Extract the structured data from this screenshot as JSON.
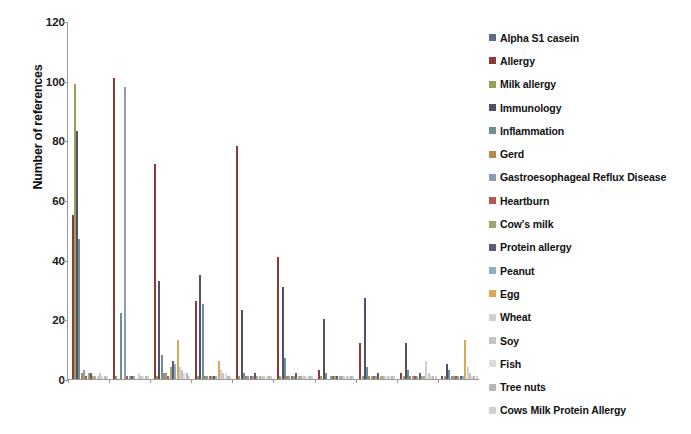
{
  "chart_data": {
    "type": "bar",
    "title": "",
    "xlabel": "",
    "ylabel": "Number of references",
    "ylim": [
      0,
      120
    ],
    "yticks": [
      0,
      20,
      40,
      60,
      80,
      100,
      120
    ],
    "grid": false,
    "legend_position": "right",
    "categories": [
      "MUC5B",
      "FANCD2",
      "MUC6",
      "TPSAB1",
      "MUC16",
      "MAP2K3",
      "NCOR1",
      "PRSS1",
      "KRT18",
      "AQP7"
    ],
    "series": [
      {
        "name": "Alpha S1 casein",
        "color": "#5b6b84",
        "values": [
          0,
          0,
          0,
          0,
          0,
          0,
          0,
          0,
          0,
          0
        ]
      },
      {
        "name": "Allergy",
        "color": "#8c3a33",
        "values": [
          55,
          101,
          72,
          26,
          78,
          41,
          3,
          12,
          2,
          1
        ]
      },
      {
        "name": "Milk allergy",
        "color": "#95a05a",
        "values": [
          99,
          1,
          1,
          1,
          1,
          1,
          1,
          1,
          1,
          1
        ]
      },
      {
        "name": "Immunology",
        "color": "#534f6b",
        "values": [
          83,
          0,
          33,
          35,
          23,
          31,
          20,
          27,
          12,
          5
        ]
      },
      {
        "name": "Inflammation",
        "color": "#6d8e95",
        "values": [
          47,
          22,
          8,
          25,
          2,
          7,
          2,
          4,
          3,
          3
        ]
      },
      {
        "name": "Gerd",
        "color": "#b08a4e",
        "values": [
          2,
          0,
          2,
          1,
          1,
          1,
          0,
          1,
          1,
          1
        ]
      },
      {
        "name": "Gastroesophageal  Reflux Disease",
        "color": "#8d9cb5",
        "values": [
          3,
          98,
          2,
          1,
          1,
          1,
          1,
          1,
          1,
          1
        ]
      },
      {
        "name": "Heartburn",
        "color": "#b5564f",
        "values": [
          1,
          1,
          1,
          1,
          1,
          1,
          1,
          1,
          1,
          1
        ]
      },
      {
        "name": "Cow's milk",
        "color": "#9aa86b",
        "values": [
          2,
          1,
          4,
          1,
          1,
          1,
          1,
          1,
          1,
          1
        ]
      },
      {
        "name": "Protein allergy",
        "color": "#5f5a78",
        "values": [
          2,
          1,
          6,
          1,
          2,
          2,
          1,
          2,
          2,
          1
        ]
      },
      {
        "name": "Peanut",
        "color": "#8fb0c4",
        "values": [
          1,
          1,
          5,
          1,
          1,
          1,
          1,
          1,
          1,
          1
        ]
      },
      {
        "name": "Egg",
        "color": "#d9a756",
        "values": [
          1,
          0,
          13,
          6,
          1,
          1,
          1,
          1,
          1,
          13
        ]
      },
      {
        "name": "Wheat",
        "color": "#cfcfcf",
        "values": [
          1,
          2,
          4,
          3,
          1,
          1,
          1,
          1,
          6,
          4
        ]
      },
      {
        "name": "Soy",
        "color": "#c4c4c4",
        "values": [
          2,
          1,
          3,
          2,
          1,
          1,
          1,
          1,
          2,
          2
        ]
      },
      {
        "name": "Fish",
        "color": "#dcdcdc",
        "values": [
          1,
          1,
          2,
          2,
          1,
          1,
          1,
          1,
          1,
          1
        ]
      },
      {
        "name": "Tree nuts",
        "color": "#b8b8b8",
        "values": [
          1,
          1,
          2,
          1,
          1,
          1,
          1,
          1,
          1,
          1
        ]
      },
      {
        "name": "Cows Milk Protein Allergy",
        "color": "#d0d0d0",
        "values": [
          1,
          1,
          1,
          1,
          1,
          1,
          1,
          1,
          1,
          1
        ]
      }
    ],
    "legend_entries": [
      "Alpha S1 casein",
      "Allergy",
      "Milk allergy",
      "Immunology",
      "Inflammation",
      "Gerd",
      "Gastroesophageal  Reflux Disease",
      "Heartburn",
      "Cow's milk",
      "Protein allergy",
      "Peanut",
      "Egg",
      "Wheat",
      "Soy",
      "Fish",
      "Tree nuts",
      "Cows Milk Protein Allergy"
    ]
  }
}
